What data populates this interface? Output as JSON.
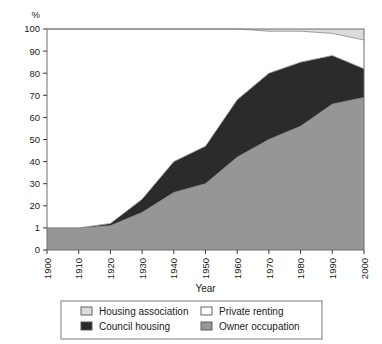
{
  "chart_data": {
    "type": "area",
    "title": "",
    "xlabel": "Year",
    "ylabel": "%",
    "stacked": true,
    "grid": false,
    "legend_position": "bottom",
    "xlim": [
      1900,
      2000
    ],
    "ylim": [
      0,
      100
    ],
    "x": [
      1900,
      1910,
      1920,
      1930,
      1940,
      1950,
      1960,
      1970,
      1980,
      1990,
      2000
    ],
    "xtick_labels": [
      "1900",
      "1910",
      "1920",
      "1930",
      "1940",
      "1950",
      "1960",
      "1970",
      "1980",
      "1990",
      "2000"
    ],
    "ytick_values": [
      0,
      10,
      20,
      30,
      40,
      50,
      60,
      70,
      80,
      90,
      100
    ],
    "ytick_labels": [
      "0",
      "1",
      "20",
      "30",
      "40",
      "50",
      "60",
      "70",
      "80",
      "90",
      "100"
    ],
    "series": [
      {
        "name": "Owner occupation",
        "color": "#969696",
        "values": [
          10,
          10,
          11,
          17,
          26,
          30,
          42,
          50,
          56,
          66,
          69
        ]
      },
      {
        "name": "Council housing",
        "color": "#2b2b2b",
        "values": [
          0,
          0,
          1,
          6,
          14,
          17,
          26,
          30,
          29,
          22,
          13
        ]
      },
      {
        "name": "Private renting",
        "color": "#ffffff",
        "values": [
          90,
          90,
          88,
          77,
          60,
          53,
          32,
          19,
          14,
          10,
          13
        ]
      },
      {
        "name": "Housing association",
        "color": "#dcdcdc",
        "values": [
          0,
          0,
          0,
          0,
          0,
          0,
          0,
          1,
          1,
          2,
          5
        ]
      }
    ],
    "stack_order": [
      "Owner occupation",
      "Council housing",
      "Private renting",
      "Housing association"
    ],
    "cumulative_tops": {
      "owner_occupation": [
        10,
        10,
        11,
        17,
        26,
        30,
        42,
        50,
        56,
        66,
        69
      ],
      "council_housing": [
        10,
        10,
        12,
        23,
        40,
        47,
        68,
        80,
        85,
        88,
        82
      ],
      "private_renting": [
        100,
        100,
        100,
        100,
        100,
        100,
        100,
        99,
        99,
        98,
        95
      ],
      "housing_association": [
        100,
        100,
        100,
        100,
        100,
        100,
        100,
        100,
        100,
        100,
        100
      ]
    },
    "legend": [
      {
        "label": "Housing association",
        "color": "#dcdcdc"
      },
      {
        "label": "Private renting",
        "color": "#ffffff"
      },
      {
        "label": "Council housing",
        "color": "#2b2b2b"
      },
      {
        "label": "Owner occupation",
        "color": "#969696"
      }
    ]
  }
}
